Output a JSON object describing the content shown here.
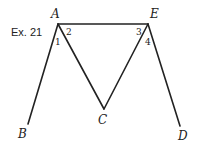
{
  "exercise_label": "Ex. 21",
  "points": {
    "A": {
      "label": "A",
      "x": 58,
      "y": 24
    },
    "E": {
      "label": "E",
      "x": 148,
      "y": 24
    },
    "B": {
      "label": "B",
      "x": 28,
      "y": 124
    },
    "C": {
      "label": "C",
      "x": 104,
      "y": 109
    },
    "D": {
      "label": "D",
      "x": 180,
      "y": 126
    }
  },
  "angles": {
    "a1": "1",
    "a2": "2",
    "a3": "3",
    "a4": "4"
  },
  "segments": [
    "AE",
    "AB",
    "AC",
    "EC",
    "ED"
  ],
  "colors": {
    "stroke": "#222222",
    "background": "#ffffff"
  }
}
